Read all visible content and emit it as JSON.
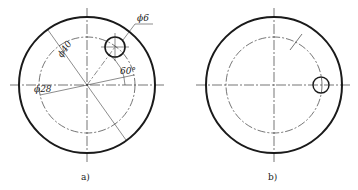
{
  "figures": [
    {
      "id": "a",
      "caption": "a)",
      "outer_circle": {
        "cx": 87,
        "cy": 85,
        "r": 68
      },
      "pitch_circle": {
        "r": 48
      },
      "hole": {
        "cx": 115,
        "cy": 47,
        "r": 10
      },
      "labels": {
        "hole_dia": "ϕ6",
        "outer_dia": "ϕ40",
        "pitch_dia": "ϕ28",
        "angle": "60°"
      }
    },
    {
      "id": "b",
      "caption": "b)",
      "outer_circle": {
        "cx": 274,
        "cy": 85,
        "r": 68
      },
      "pitch_circle": {
        "r": 48
      },
      "hole": {
        "cx": 321,
        "cy": 85,
        "r": 8
      }
    }
  ],
  "colors": {
    "line": "#1a1a1a",
    "centerline": "#333333"
  }
}
